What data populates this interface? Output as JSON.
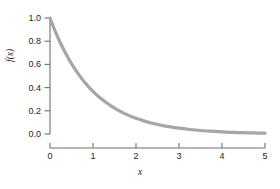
{
  "chart_data": {
    "type": "line",
    "title": "",
    "subtitle": "",
    "xlabel": "x",
    "ylabel": "f(x)",
    "xlim": [
      0,
      5
    ],
    "ylim": [
      0.0,
      1.0
    ],
    "grid": false,
    "legend": null,
    "curve_color": "#a6a6a6",
    "axis_color": "#6d6e71",
    "text_color": "#231f20",
    "xticks": [
      "0",
      "1",
      "2",
      "3",
      "4",
      "5"
    ],
    "xtick_values": [
      0,
      1,
      2,
      3,
      4,
      5
    ],
    "yticks": [
      "0.0",
      "0.2",
      "0.4",
      "0.6",
      "0.8",
      "1.0"
    ],
    "ytick_values": [
      0.0,
      0.2,
      0.4,
      0.6,
      0.8,
      1.0
    ],
    "series": [
      {
        "name": "f(x) = e^(-x)",
        "x": [
          0.0,
          0.1,
          0.2,
          0.3,
          0.4,
          0.5,
          0.6,
          0.7,
          0.8,
          0.9,
          1.0,
          1.2,
          1.4,
          1.6,
          1.8,
          2.0,
          2.2,
          2.4,
          2.6,
          2.8,
          3.0,
          3.25,
          3.5,
          3.75,
          4.0,
          4.25,
          4.5,
          4.75,
          5.0
        ],
        "values": [
          1.0,
          0.905,
          0.819,
          0.741,
          0.67,
          0.607,
          0.549,
          0.497,
          0.449,
          0.407,
          0.368,
          0.301,
          0.247,
          0.202,
          0.165,
          0.135,
          0.111,
          0.091,
          0.074,
          0.061,
          0.05,
          0.039,
          0.03,
          0.024,
          0.018,
          0.014,
          0.011,
          0.009,
          0.007
        ]
      }
    ]
  },
  "figure": {
    "x_axis_title": "x",
    "y_axis_title": "f(x)"
  }
}
